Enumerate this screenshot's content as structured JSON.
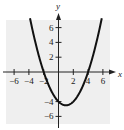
{
  "chart_data": {
    "type": "line",
    "title": "",
    "xlabel": "x",
    "ylabel": "y",
    "xlim": [
      -7,
      7
    ],
    "ylim": [
      -7,
      7
    ],
    "grid": true,
    "x_ticks": [
      -6,
      -4,
      -2,
      2,
      4,
      6
    ],
    "y_ticks": [
      6,
      4,
      2,
      -4,
      -6
    ],
    "x_tick_labels": [
      "−6",
      "−4",
      "−2",
      "2",
      "4",
      "6"
    ],
    "y_tick_labels": [
      "6",
      "4",
      "2",
      "−4",
      "−6"
    ],
    "series": [
      {
        "name": "parabola",
        "equation": "y = (x^2 - 2x - 8)/2",
        "x": [
          -3.8,
          -3,
          -2,
          -1,
          0,
          1,
          2,
          3,
          4,
          5,
          5.8
        ],
        "y": [
          7.0,
          3.5,
          0,
          -2.5,
          -4,
          -4.5,
          -4,
          -2.5,
          0,
          3.5,
          7.0
        ]
      }
    ],
    "key_points": {
      "vertex": [
        1,
        -4.5
      ],
      "x_intercepts": [
        -2,
        4
      ],
      "y_intercept": -4
    }
  },
  "labels": {
    "x_axis": "x",
    "y_axis": "y"
  }
}
